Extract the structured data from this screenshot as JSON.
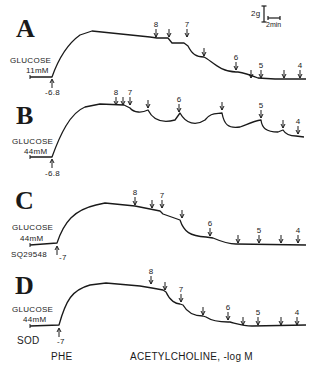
{
  "figure": {
    "scale_bar": {
      "force_label": "2g",
      "time_label": "2min"
    },
    "x_axis_caption": "ACETYLCHOLINE, -log M",
    "pretreatment_caption": "PHE",
    "panels": [
      {
        "letter": "A",
        "glucose_label": "GLUCOSE",
        "glucose_conc": "11mM",
        "treatment": "",
        "phe_dose": "-6.8",
        "trace": "M30,77 L52,77 C58,60 66,45 80,35 L92,31 L150,37 L157,38 L168,38 L172,43 L184,43 L188,46 C192,54 196,57 204,57 C212,61 220,72 236,72 L238,72 C244,73 250,75 258,78 L275,79 L306,79",
        "arrows": [
          {
            "x": 156,
            "y": 29,
            "label": "8"
          },
          {
            "x": 169,
            "y": 29,
            "label": ""
          },
          {
            "x": 187,
            "y": 29,
            "label": "7"
          },
          {
            "x": 204,
            "y": 48,
            "label": ""
          },
          {
            "x": 236,
            "y": 62,
            "label": "6"
          },
          {
            "x": 251,
            "y": 70,
            "label": ""
          },
          {
            "x": 261,
            "y": 70,
            "label": "5"
          },
          {
            "x": 284,
            "y": 70,
            "label": ""
          },
          {
            "x": 300,
            "y": 70,
            "label": "4"
          }
        ]
      },
      {
        "letter": "B",
        "glucose_label": "GLUCOSE",
        "glucose_conc": "44mM",
        "treatment": "",
        "phe_dose": "-6.8",
        "trace": "M30,157 L52,157 C60,135 70,113 85,107 L100,104 L124,105 L130,108 C134,113 142,113 148,110 C152,118 160,124 175,120 L180,113 C186,124 196,126 205,120 C210,113 215,114 222,113 C224,124 228,129 240,127 C248,124 254,121 261,120 C262,128 266,132 278,132 L283,130 C286,135 290,136 296,136 L304,137",
        "arrows": [
          {
            "x": 116,
            "y": 97,
            "label": "8"
          },
          {
            "x": 123,
            "y": 97,
            "label": ""
          },
          {
            "x": 130,
            "y": 97,
            "label": "7"
          },
          {
            "x": 148,
            "y": 100,
            "label": ""
          },
          {
            "x": 179,
            "y": 104,
            "label": "6"
          },
          {
            "x": 222,
            "y": 102,
            "label": ""
          },
          {
            "x": 261,
            "y": 110,
            "label": "5"
          },
          {
            "x": 283,
            "y": 120,
            "label": ""
          },
          {
            "x": 298,
            "y": 126,
            "label": "4"
          }
        ]
      },
      {
        "letter": "C",
        "glucose_label": "GLUCOSE",
        "glucose_conc": "44mM",
        "treatment": "SQ29548",
        "phe_dose": "-7",
        "trace": "M30,245 L57,243 C64,222 74,210 96,205 L105,203 L135,206 L150,209 L160,211 L163,214 L180,220 C184,232 190,236 206,237 L213,238 C220,241 228,244 236,244 L306,245",
        "arrows": [
          {
            "x": 135,
            "y": 197,
            "label": "8"
          },
          {
            "x": 152,
            "y": 200,
            "label": ""
          },
          {
            "x": 162,
            "y": 200,
            "label": "7"
          },
          {
            "x": 182,
            "y": 210,
            "label": ""
          },
          {
            "x": 210,
            "y": 228,
            "label": "6"
          },
          {
            "x": 238,
            "y": 235,
            "label": ""
          },
          {
            "x": 259,
            "y": 235,
            "label": "5"
          },
          {
            "x": 281,
            "y": 235,
            "label": ""
          },
          {
            "x": 298,
            "y": 235,
            "label": "4"
          }
        ]
      },
      {
        "letter": "D",
        "glucose_label": "GLUCOSE",
        "glucose_conc": "44mM",
        "treatment": "SOD",
        "phe_dose": "-7",
        "trace": "M30,326 L59,325 C66,300 72,290 90,285 L106,283 L140,286 L152,288 L163,290 L166,292 C170,301 176,304 180,304 L183,305 C188,314 196,316 203,316 L206,317 C212,321 220,322 228,322 L230,322 C238,324 244,326 252,326 L306,325",
        "arrows": [
          {
            "x": 151,
            "y": 276,
            "label": "8"
          },
          {
            "x": 165,
            "y": 282,
            "label": ""
          },
          {
            "x": 181,
            "y": 294,
            "label": "7"
          },
          {
            "x": 203,
            "y": 307,
            "label": ""
          },
          {
            "x": 228,
            "y": 312,
            "label": "6"
          },
          {
            "x": 243,
            "y": 317,
            "label": ""
          },
          {
            "x": 258,
            "y": 317,
            "label": "5"
          },
          {
            "x": 281,
            "y": 317,
            "label": ""
          },
          {
            "x": 297,
            "y": 317,
            "label": "4"
          }
        ]
      }
    ]
  }
}
